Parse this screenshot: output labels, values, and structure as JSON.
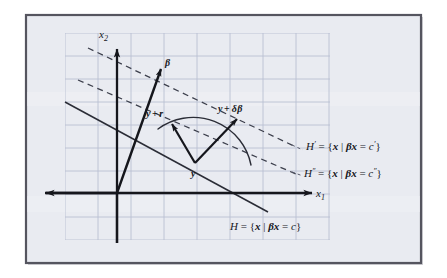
{
  "figure": {
    "type": "vector-geometry-diagram",
    "frame": {
      "border_color": "#55555f",
      "inner_background": "#e9ebf1",
      "outer_background": "#ffffff"
    },
    "grid": {
      "visible": true,
      "color": "#b9c0d2",
      "cell_width": 33,
      "cell_height": 23
    },
    "axes": {
      "x_label": "x",
      "x_sub": "1",
      "y_label": "x",
      "y_sub": "2",
      "color": "#15161c",
      "origin": {
        "x": 117,
        "y": 193
      }
    },
    "vectors": [
      {
        "name": "beta-vector",
        "label": "β",
        "from": {
          "x": 117,
          "y": 193
        },
        "to": {
          "x": 160,
          "y": 70
        },
        "style": "solid"
      },
      {
        "name": "residual-vector",
        "label": "y + r",
        "label_parts": {
          "base": "y",
          "op": "+",
          "term": "r"
        },
        "from": {
          "x": 195,
          "y": 163
        },
        "to": {
          "x": 172,
          "y": 124
        },
        "style": "solid"
      },
      {
        "name": "delta-beta-vector",
        "label": "y + δβ",
        "label_parts": {
          "base": "y",
          "op": "+",
          "term": "δβ"
        },
        "from": {
          "x": 195,
          "y": 163
        },
        "to": {
          "x": 236,
          "y": 119
        },
        "style": "solid"
      }
    ],
    "points": [
      {
        "name": "point-y",
        "label": "y",
        "x": 195,
        "y": 163
      }
    ],
    "arc": {
      "name": "radius-arc",
      "description": "circular arc of constant radius centered at y",
      "center": {
        "x": 195,
        "y": 163
      },
      "radius": 59
    },
    "lines": [
      {
        "name": "hyperplane-H",
        "style": "solid",
        "label": "H = {x | βx = c}",
        "label_parts": {
          "lhs": "H",
          "prime": "",
          "eq": " = {",
          "var": "x",
          "bar": " | ",
          "beta": "β",
          "x": "x",
          "eq2": " = ",
          "c": "c",
          "c_prime": "",
          "close": "}"
        },
        "from": {
          "x": 65,
          "y": 102
        },
        "to": {
          "x": 266,
          "y": 211
        }
      },
      {
        "name": "hyperplane-H-prime",
        "style": "dashed",
        "label": "H′ = {x | βx = c′}",
        "label_parts": {
          "lhs": "H",
          "prime": "′",
          "eq": " = {",
          "var": "x",
          "bar": " | ",
          "beta": "β",
          "x": "x",
          "eq2": " = ",
          "c": "c",
          "c_prime": "′",
          "close": "}"
        },
        "from": {
          "x": 88,
          "y": 48
        },
        "to": {
          "x": 292,
          "y": 145
        }
      },
      {
        "name": "hyperplane-H-double-prime",
        "style": "dashed",
        "label": "H″ = {x | βx = c″}",
        "label_parts": {
          "lhs": "H",
          "prime": "″",
          "eq": " = {",
          "var": "x",
          "bar": " | ",
          "beta": "β",
          "x": "x",
          "eq2": " = ",
          "c": "c",
          "c_prime": "″",
          "close": "}"
        },
        "from": {
          "x": 78,
          "y": 80
        },
        "to": {
          "x": 292,
          "y": 172
        }
      }
    ],
    "labels": {
      "beta": "β",
      "y": "y",
      "y_plus_r_base": "y",
      "y_plus_r_plus": "+",
      "y_plus_r_term": "r",
      "y_plus_db_base": "y",
      "y_plus_db_plus": "+",
      "y_plus_db_delta": "δ",
      "y_plus_db_beta": "β",
      "x1_base": "x",
      "x1_sub": "1",
      "x2_base": "x",
      "x2_sub": "2",
      "H_name": "H",
      "H_prime_name": "H",
      "H_prime_mark": "′",
      "H_dprime_name": "H",
      "H_dprime_mark": "″",
      "set_open": " = {",
      "set_var": "x",
      "set_bar": " | ",
      "set_beta": "β",
      "set_x": "x",
      "set_eq": " = ",
      "c_plain": "c",
      "c_prime": "c",
      "c_prime_mark": "′",
      "c_dprime": "c",
      "c_dprime_mark": "″",
      "set_close": "}"
    }
  }
}
